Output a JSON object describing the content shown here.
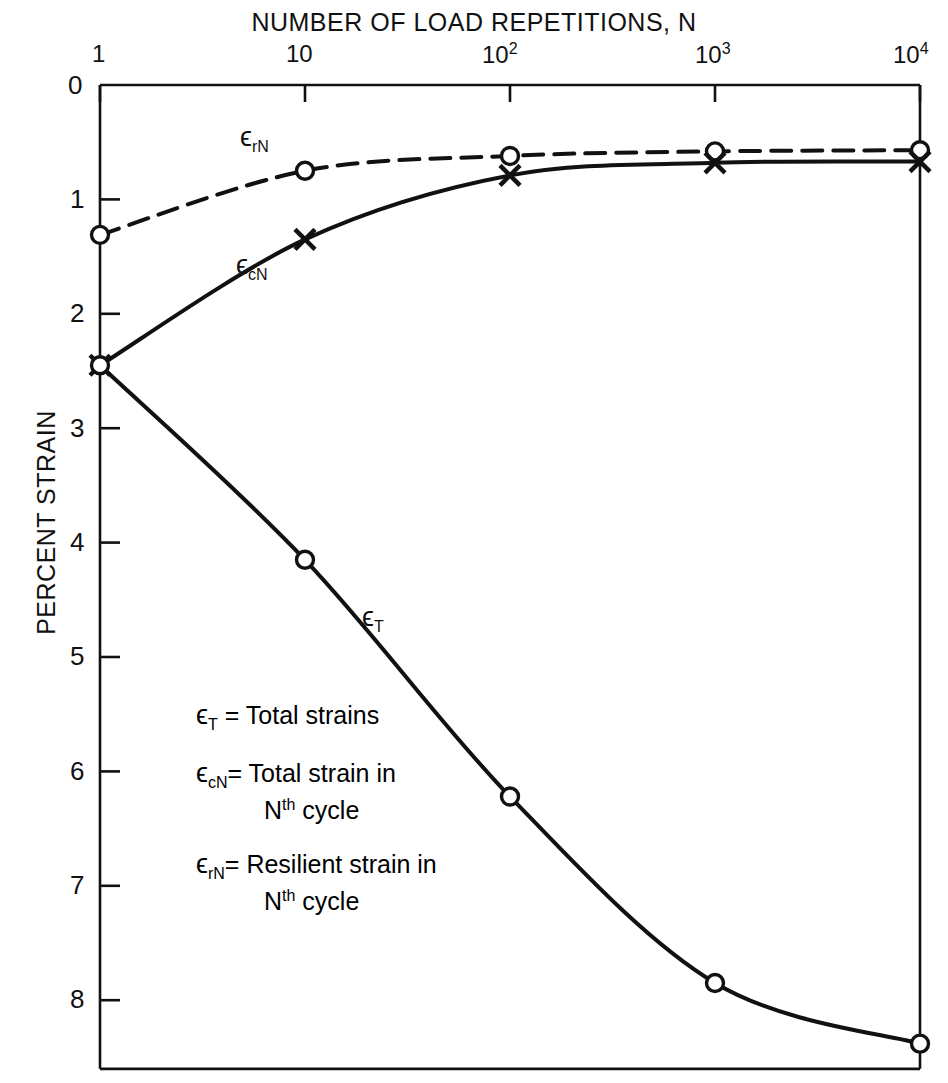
{
  "chart_data": {
    "type": "line",
    "title": "NUMBER OF LOAD REPETITIONS, N",
    "xlabel": "NUMBER OF LOAD REPETITIONS, N",
    "ylabel": "PERCENT STRAIN",
    "x_scale": "log",
    "xlim": [
      1,
      10000
    ],
    "ylim": [
      0,
      8.6
    ],
    "y_inverted": true,
    "grid": false,
    "legend_position": "inside-lower-left",
    "x_ticks": [
      {
        "value": 1,
        "label": "1"
      },
      {
        "value": 10,
        "label": "10"
      },
      {
        "value": 100,
        "label": "10",
        "exponent": "2"
      },
      {
        "value": 1000,
        "label": "10",
        "exponent": "3"
      },
      {
        "value": 10000,
        "label": "10",
        "exponent": "4"
      }
    ],
    "y_ticks": [
      {
        "value": 0,
        "label": "0"
      },
      {
        "value": 1,
        "label": "1"
      },
      {
        "value": 2,
        "label": "2"
      },
      {
        "value": 3,
        "label": "3"
      },
      {
        "value": 4,
        "label": "4"
      },
      {
        "value": 5,
        "label": "5"
      },
      {
        "value": 6,
        "label": "6"
      },
      {
        "value": 7,
        "label": "7"
      },
      {
        "value": 8,
        "label": "8"
      }
    ],
    "series": [
      {
        "name": "resilient-strain",
        "label_main": "ϵ",
        "label_sub": "rN",
        "style": "dashed",
        "marker": "circle",
        "x": [
          1,
          10,
          100,
          1000,
          10000
        ],
        "y": [
          1.31,
          0.75,
          0.62,
          0.58,
          0.57
        ]
      },
      {
        "name": "total-strain-nth-cycle",
        "label_main": "ϵ",
        "label_sub": "cN",
        "style": "solid",
        "marker": "cross",
        "x": [
          1,
          10,
          100,
          1000,
          10000
        ],
        "y": [
          2.45,
          1.35,
          0.79,
          0.68,
          0.67
        ]
      },
      {
        "name": "total-strain",
        "label_main": "ϵ",
        "label_sub": "T",
        "style": "solid",
        "marker": "circle",
        "x": [
          1,
          10,
          100,
          1000,
          10000
        ],
        "y": [
          2.45,
          4.15,
          6.22,
          7.85,
          8.38
        ]
      }
    ],
    "annotations": [
      {
        "name": "curve-label-resilient",
        "text": "ϵ",
        "sub": "rN",
        "x": 10,
        "y": 0.42
      },
      {
        "name": "curve-label-cyclic",
        "text": "ϵ",
        "sub": "cN",
        "x": 13,
        "y": 1.82
      },
      {
        "name": "curve-label-total",
        "text": "ϵ",
        "sub": "T",
        "x": 52,
        "y": 4.68
      }
    ]
  },
  "legend": {
    "entries": [
      {
        "symbol": "ϵ",
        "subscript": "T",
        "equals": "=",
        "text": "Total  strains",
        "continuation": ""
      },
      {
        "symbol": "ϵ",
        "subscript": "cN",
        "equals": "=",
        "text": "Total  strain in",
        "continuation": "cycle",
        "continuation_sup_base": "N",
        "continuation_sup": "th"
      },
      {
        "symbol": "ϵ",
        "subscript": "rN",
        "equals": "=",
        "text": "Resilient strain  in",
        "continuation": "cycle",
        "continuation_sup_base": "N",
        "continuation_sup": "th"
      }
    ]
  },
  "style": {
    "stroke": "#111111",
    "background": "#ffffff",
    "axis_width": 2.6,
    "curve_width": 4.0
  }
}
